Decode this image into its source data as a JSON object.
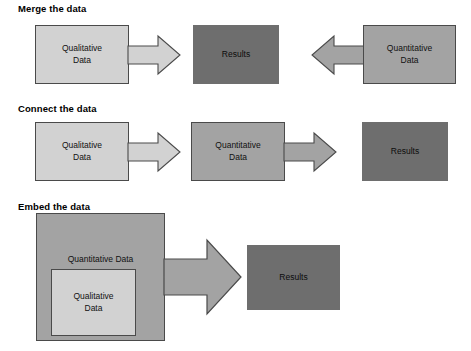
{
  "figure": {
    "background_color": "#ffffff"
  },
  "palette": {
    "qualitative_fill": "#d2d2d2",
    "quantitative_fill": "#a3a3a3",
    "results_fill": "#6e6e6e",
    "outline": "#4a4a4a",
    "text": "#111111"
  },
  "sections": [
    {
      "heading": "Merge the data",
      "nodes": {
        "qualitative": "Qualitative\nData",
        "results": "Results",
        "quantitative": "Quantitative\nData"
      },
      "flow": "qualitative and quantitative both point inward to results"
    },
    {
      "heading": "Connect the data",
      "nodes": {
        "qualitative": "Qualitative\nData",
        "quantitative": "Quantitative\nData",
        "results": "Results"
      },
      "flow": "qualitative to quantitative to results, left to right"
    },
    {
      "heading": "Embed the data",
      "nodes": {
        "quantitative": "Quantitative Data",
        "qualitative": "Qualitative\nData",
        "results": "Results"
      },
      "flow": "qualitative nested inside quantitative, pointing to results"
    }
  ],
  "labels": {
    "merge_heading": "Merge the data",
    "connect_heading": "Connect the data",
    "embed_heading": "Embed the data",
    "qualitative_line1": "Qualitative",
    "qualitative_line2": "Data",
    "quantitative_line1": "Quantitative",
    "quantitative_line2": "Data",
    "quantitative_single": "Quantitative Data",
    "results": "Results"
  }
}
